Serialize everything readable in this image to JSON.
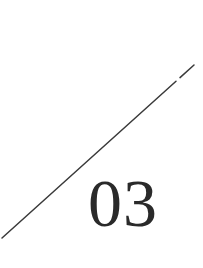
{
  "graphic": {
    "number_label": "03",
    "colors": {
      "background": "#ffffff",
      "stroke": "#3a3a3a",
      "text": "#2a2a2a"
    },
    "diagonal_line": {
      "x1": 2,
      "y1": 238,
      "x2": 194,
      "y2": 65,
      "gap_at": [
        178,
        81
      ]
    }
  }
}
